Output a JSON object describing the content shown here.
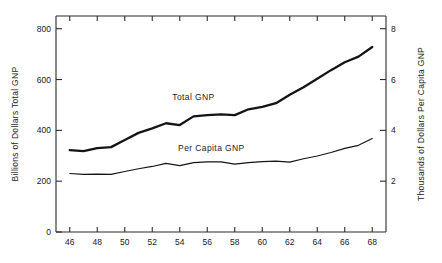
{
  "chart_data": {
    "type": "line",
    "title": "",
    "xlabel": "",
    "ylabel": "Billions of Dollars Total GNP",
    "y2label": "Thousands of Dollars Per Capita GNP",
    "grid": false,
    "legend_position": "inline-annotation",
    "xlim": [
      45,
      69
    ],
    "ylim": [
      0,
      850
    ],
    "y2lim": [
      0,
      8.5
    ],
    "xticks": [
      46,
      48,
      50,
      52,
      54,
      56,
      58,
      60,
      62,
      64,
      66,
      68
    ],
    "xticklabels": [
      "46",
      "48",
      "50",
      "52",
      "54",
      "56",
      "58",
      "60",
      "62",
      "64",
      "66",
      "68"
    ],
    "yticks": [
      0,
      200,
      400,
      600,
      800
    ],
    "yticklabels": [
      "0",
      "200",
      "400",
      "600",
      "800"
    ],
    "y2ticks": [
      2,
      4,
      6,
      8
    ],
    "y2ticklabels": [
      "2",
      "4",
      "6",
      "8"
    ],
    "x": [
      46,
      47,
      48,
      49,
      50,
      51,
      52,
      53,
      54,
      55,
      56,
      57,
      58,
      59,
      60,
      61,
      62,
      63,
      64,
      65,
      66,
      67,
      68
    ],
    "series": [
      {
        "name": "Total GNP",
        "axis": "left",
        "units": "Billions of Dollars",
        "values": [
          322,
          318,
          330,
          334,
          362,
          390,
          408,
          428,
          421,
          455,
          460,
          463,
          460,
          483,
          492,
          507,
          540,
          570,
          603,
          637,
          668,
          690,
          728
        ]
      },
      {
        "name": "Per Capita GNP",
        "axis": "right",
        "units": "Thousands of Dollars",
        "values": [
          2.3,
          2.27,
          2.28,
          2.27,
          2.38,
          2.49,
          2.58,
          2.7,
          2.61,
          2.73,
          2.76,
          2.76,
          2.67,
          2.73,
          2.77,
          2.79,
          2.75,
          2.88,
          2.99,
          3.13,
          3.29,
          3.41,
          3.68
        ]
      }
    ],
    "annotations": [
      {
        "name": "total-gnp-label",
        "text": "Total GNP",
        "x": 55.0,
        "y": 520
      },
      {
        "name": "per-capita-gnp-label",
        "text": "Per Capita GNP",
        "x": 56.3,
        "y": 320
      }
    ]
  },
  "axes": {
    "left_title": "Billions of Dollars Total GNP",
    "right_title": "Thousands of Dollars Per Capita GNP"
  }
}
